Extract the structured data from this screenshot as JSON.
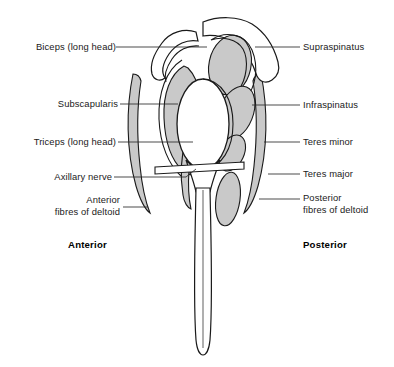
{
  "figure": {
    "colors": {
      "muscle_fill": "#c9c9c9",
      "bone_fill": "#ffffff",
      "outline": "#1a1a1a",
      "leader_line": "#2b2b2b",
      "background": "#ffffff"
    }
  },
  "labels_left": [
    {
      "id": "biceps-long-head",
      "text": "Biceps (long head)",
      "x": 14,
      "y": 41
    },
    {
      "id": "subscapularis",
      "text": "Subscapularis",
      "x": 33,
      "y": 98
    },
    {
      "id": "triceps-long-head",
      "text": "Triceps (long head)",
      "x": 12,
      "y": 137
    },
    {
      "id": "axillary-nerve",
      "text": "Axillary nerve",
      "x": 33,
      "y": 172
    },
    {
      "id": "anterior-fibres-of-deltoid",
      "text": "Anterior\nfibres of deltoid",
      "x": 32,
      "y": 195
    }
  ],
  "labels_right": [
    {
      "id": "supraspinatus",
      "text": "Supraspinatus",
      "x": 303,
      "y": 41
    },
    {
      "id": "infraspinatus",
      "text": "Infraspinatus",
      "x": 303,
      "y": 99
    },
    {
      "id": "teres-minor",
      "text": "Teres minor",
      "x": 303,
      "y": 136
    },
    {
      "id": "teres-major",
      "text": "Teres major",
      "x": 303,
      "y": 168
    },
    {
      "id": "posterior-fibres-of-deltoid",
      "text": "Posterior\nfibres of deltoid",
      "x": 303,
      "y": 192
    }
  ],
  "orientation": [
    {
      "id": "anterior",
      "text": "Anterior",
      "x": 68,
      "y": 239
    },
    {
      "id": "posterior",
      "text": "Posterior",
      "x": 303,
      "y": 239
    }
  ]
}
